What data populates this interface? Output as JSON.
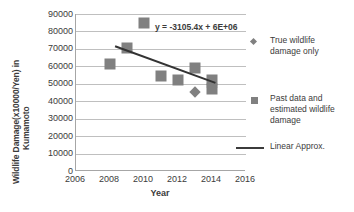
{
  "chart_data": {
    "type": "scatter",
    "title": "",
    "xlabel": "Year",
    "ylabel": "Wildlife Damage(x10000/Yen) in Kumamoto",
    "ylabel_line1": "Wildlife Damage(x10000/Yen) in",
    "ylabel_line2": "Kumamoto",
    "xlim": [
      2006,
      2016
    ],
    "ylim": [
      0,
      90000
    ],
    "xticks": [
      2006,
      2008,
      2010,
      2012,
      2014,
      2016
    ],
    "xtick_labels": [
      "2006",
      "2008",
      "2010",
      "2012",
      "2014",
      "2016"
    ],
    "yticks": [
      0,
      10000,
      20000,
      30000,
      40000,
      50000,
      60000,
      70000,
      80000,
      90000
    ],
    "ytick_labels": [
      "0",
      "10000",
      "20000",
      "30000",
      "40000",
      "50000",
      "60000",
      "70000",
      "80000",
      "90000"
    ],
    "grid": true,
    "grid_axis": "y",
    "legend_position": "right",
    "annotations": [
      {
        "name": "trendline-equation",
        "text": "y = -3105.4x + 6E+06"
      }
    ],
    "series": [
      {
        "name": "True wildlife damage only",
        "marker": "diamond",
        "color": "#808080",
        "points": [
          {
            "x": 2013,
            "y": 45500
          },
          {
            "x": 2014,
            "y": 48000
          }
        ]
      },
      {
        "name": "Past data and estimated wildlife damage",
        "marker": "square",
        "color": "#808080",
        "points": [
          {
            "x": 2008,
            "y": 61500
          },
          {
            "x": 2009,
            "y": 70500
          },
          {
            "x": 2010,
            "y": 85000
          },
          {
            "x": 2011,
            "y": 54500
          },
          {
            "x": 2012,
            "y": 52000
          },
          {
            "x": 2013,
            "y": 59000
          },
          {
            "x": 2014,
            "y": 52000
          },
          {
            "x": 2014,
            "y": 47000
          }
        ]
      },
      {
        "name": "Linear Approx.",
        "marker": "line",
        "color": "#333333",
        "line": {
          "x1": 2008.3,
          "y1": 71500,
          "x2": 2014.2,
          "y2": 50500
        }
      }
    ]
  },
  "legend": {
    "items": [
      {
        "label_line1": "True wildlife",
        "label_line2": "damage only",
        "label_line3": "",
        "key": "diamond-marker-icon"
      },
      {
        "label_line1": "Past data and",
        "label_line2": "estimated wildlife",
        "label_line3": "damage",
        "key": "square-marker-icon"
      },
      {
        "label_line1": "Linear Approx.",
        "label_line2": "",
        "label_line3": "",
        "key": "line-marker-icon"
      }
    ]
  },
  "colors": {
    "marker": "#808080",
    "trendline": "#333333",
    "gridline": "#bfbfbf",
    "axis": "#a6a6a6",
    "text": "#3b3b3b",
    "background": "#ffffff"
  }
}
